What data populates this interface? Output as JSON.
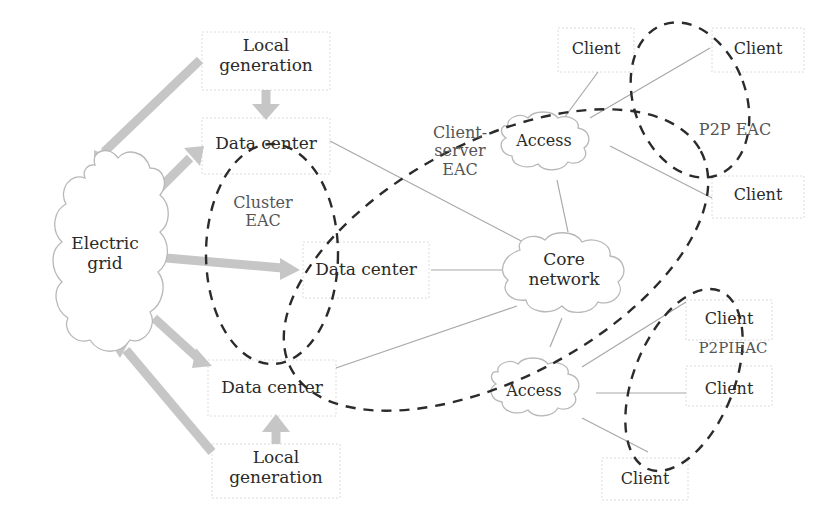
{
  "diagram": {
    "title": "",
    "colors": {
      "background": "#ffffff",
      "cloud_stroke": "#b8b8b8",
      "power_arrow": "#c8c8c8",
      "network_line": "#a8a8a8",
      "eac_dash": "#2b2b2b",
      "text": "#2a2a2a",
      "label_text": "#555555"
    },
    "nodes": {
      "electric_grid": {
        "line1": "Electric",
        "line2": "grid",
        "shape": "cloud"
      },
      "local_generation_top": {
        "line1": "Local",
        "line2": "generation",
        "shape": "box"
      },
      "local_generation_bottom": {
        "line1": "Local",
        "line2": "generation",
        "shape": "box"
      },
      "data_center_top": {
        "label": "Data center",
        "shape": "box"
      },
      "data_center_middle": {
        "label": "Data center",
        "shape": "box"
      },
      "data_center_bottom": {
        "label": "Data center",
        "shape": "box"
      },
      "core_network": {
        "line1": "Core",
        "line2": "network",
        "shape": "cloud"
      },
      "access_top": {
        "label": "Access",
        "shape": "cloud"
      },
      "access_bottom": {
        "label": "Access",
        "shape": "cloud"
      },
      "client_top_left": {
        "label": "Client",
        "shape": "box"
      },
      "client_top_right": {
        "label": "Client",
        "shape": "box"
      },
      "client_mid_right": {
        "label": "Client",
        "shape": "box"
      },
      "client_lower_top": {
        "label": "Client",
        "shape": "box"
      },
      "client_lower_mid": {
        "label": "Client",
        "shape": "box"
      },
      "client_lower_bottom": {
        "label": "Client",
        "shape": "box"
      }
    },
    "regions": {
      "cluster_eac": {
        "line1": "Cluster",
        "line2": "EAC"
      },
      "client_server_eac": {
        "line1": "Client-",
        "line2": "server",
        "line3": "EAC"
      },
      "p2p_eac_top": {
        "label": "P2P EAC"
      },
      "p2p_eac_bottom": {
        "label": "P2PIEAC"
      }
    },
    "edges": {
      "power": [
        "local_generation_top -> data_center_top",
        "local_generation_bottom -> data_center_bottom",
        "local_generation_top -> electric_grid",
        "local_generation_bottom -> electric_grid",
        "electric_grid -> data_center_top",
        "electric_grid -> data_center_middle",
        "electric_grid -> data_center_bottom"
      ],
      "network": [
        "data_center_top - core_network",
        "data_center_middle - core_network",
        "data_center_bottom - core_network",
        "core_network - access_top",
        "core_network - access_bottom",
        "access_top - client_top_left",
        "access_top - client_top_right",
        "access_top - client_mid_right",
        "access_bottom - client_lower_top",
        "access_bottom - client_lower_mid",
        "access_bottom - client_lower_bottom"
      ]
    }
  }
}
